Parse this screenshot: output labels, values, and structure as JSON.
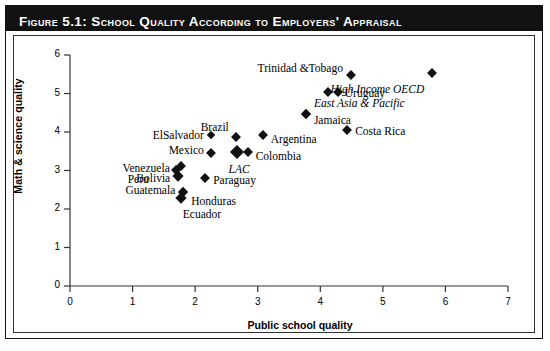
{
  "figure": {
    "title": "Figure 5.1:  School Quality According to Employers' Appraisal"
  },
  "chart_data": {
    "type": "scatter",
    "title": "School Quality According to Employers' Appraisal",
    "xlabel": "Public school quality",
    "ylabel": "Math & science quality",
    "xlim": [
      0,
      7
    ],
    "ylim": [
      0,
      6
    ],
    "xticks": [
      "0",
      "1",
      "2",
      "3",
      "4",
      "5",
      "6",
      "7"
    ],
    "yticks": [
      "0",
      "1",
      "2",
      "3",
      "4",
      "5",
      "6"
    ],
    "grid": false,
    "legend": "none",
    "marker": "filled-diamond",
    "marker_color": "#111111",
    "points": [
      {
        "label": "Trinidad &Tobago",
        "x": 4.49,
        "y": 5.48,
        "lpos": "r",
        "ldx": -8,
        "ldy": -7,
        "italic": false,
        "size": 7
      },
      {
        "label": "High Income OECD",
        "x": 5.79,
        "y": 5.52,
        "lpos": "r",
        "ldx": -8,
        "ldy": 16,
        "italic": true,
        "size": 7
      },
      {
        "label": "Uruguay",
        "x": 4.28,
        "y": 5.05,
        "lpos": "l",
        "ldx": 7,
        "ldy": 1,
        "italic": false,
        "size": 7
      },
      {
        "label": "",
        "x": 4.12,
        "y": 5.05,
        "lpos": "l",
        "ldx": 0,
        "ldy": 0,
        "italic": false,
        "size": 7
      },
      {
        "label": "East Asia & Pacific",
        "x": 3.77,
        "y": 4.47,
        "lpos": "l",
        "ldx": 8,
        "ldy": -11,
        "italic": true,
        "size": 7
      },
      {
        "label": "Jamaica",
        "x": 3.77,
        "y": 4.47,
        "lpos": "l",
        "ldx": 8,
        "ldy": 6,
        "italic": false,
        "size": 7
      },
      {
        "label": "Costa Rica",
        "x": 4.43,
        "y": 4.06,
        "lpos": "l",
        "ldx": 8,
        "ldy": 1,
        "italic": false,
        "size": 7
      },
      {
        "label": "Argentina",
        "x": 3.08,
        "y": 3.92,
        "lpos": "l",
        "ldx": 8,
        "ldy": 4,
        "italic": false,
        "size": 7
      },
      {
        "label": "Brazil",
        "x": 2.65,
        "y": 3.88,
        "lpos": "r",
        "ldx": -7,
        "ldy": -10,
        "italic": false,
        "size": 7
      },
      {
        "label": "ElSalvador",
        "x": 2.25,
        "y": 3.92,
        "lpos": "r",
        "ldx": -7,
        "ldy": 0,
        "italic": false,
        "size": 6
      },
      {
        "label": "Colombia",
        "x": 2.84,
        "y": 3.48,
        "lpos": "l",
        "ldx": 8,
        "ldy": 4,
        "italic": false,
        "size": 7
      },
      {
        "label": "LAC",
        "x": 2.67,
        "y": 3.48,
        "lpos": "c",
        "ldx": 2,
        "ldy": 17,
        "italic": true,
        "size": 10
      },
      {
        "label": "Mexico",
        "x": 2.25,
        "y": 3.45,
        "lpos": "r",
        "ldx": -7,
        "ldy": -3,
        "italic": false,
        "size": 7
      },
      {
        "label": "Peru",
        "x": 1.77,
        "y": 3.12,
        "lpos": "r",
        "ldx": -32,
        "ldy": 13,
        "italic": false,
        "size": 7
      },
      {
        "label": "Venezuela",
        "x": 1.69,
        "y": 3.01,
        "lpos": "r",
        "ldx": -6,
        "ldy": -2,
        "italic": false,
        "size": 7
      },
      {
        "label": "Bolivia",
        "x": 1.73,
        "y": 2.85,
        "lpos": "r",
        "ldx": -8,
        "ldy": 2,
        "italic": false,
        "size": 8
      },
      {
        "label": "Paraguay",
        "x": 2.16,
        "y": 2.81,
        "lpos": "l",
        "ldx": 8,
        "ldy": 2,
        "italic": false,
        "size": 7
      },
      {
        "label": "Guatemala",
        "x": 1.81,
        "y": 2.44,
        "lpos": "r",
        "ldx": -8,
        "ldy": -2,
        "italic": false,
        "size": 7
      },
      {
        "label": "Honduras",
        "x": 1.81,
        "y": 2.44,
        "lpos": "l",
        "ldx": 8,
        "ldy": 9,
        "italic": false,
        "size": 7
      },
      {
        "label": "Ecuador",
        "x": 1.77,
        "y": 2.28,
        "lpos": "l",
        "ldx": 2,
        "ldy": 16,
        "italic": false,
        "size": 8
      }
    ]
  }
}
